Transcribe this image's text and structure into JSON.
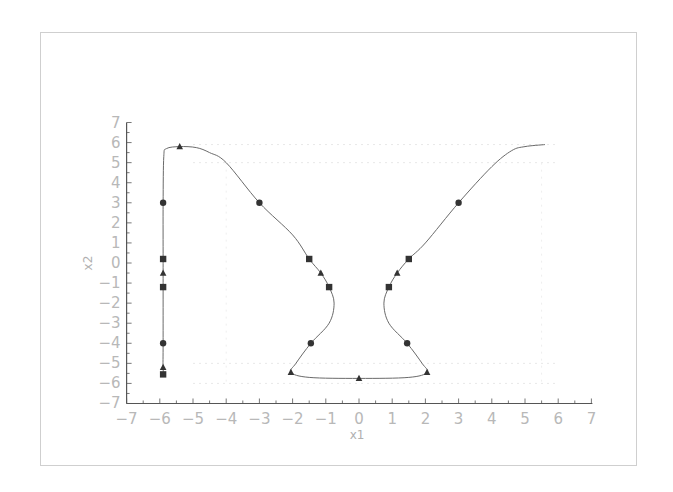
{
  "chart_data": {
    "type": "line",
    "title": "",
    "xlabel": "x1",
    "ylabel": "x2",
    "xlim": [
      -7,
      7
    ],
    "ylim": [
      -7,
      7
    ],
    "xticks": [
      -7,
      -6,
      -5,
      -4,
      -3,
      -2,
      -1,
      0,
      1,
      2,
      3,
      4,
      5,
      6,
      7
    ],
    "yticks": [
      -7,
      -6,
      -5,
      -4,
      -3,
      -2,
      -1,
      0,
      1,
      2,
      3,
      4,
      5,
      6,
      7
    ],
    "grid": false,
    "legend": null,
    "series": [
      {
        "name": "left-trajectory",
        "curve": [
          [
            -5.85,
            -5.65
          ],
          [
            -5.9,
            -5.3
          ],
          [
            -5.9,
            -4
          ],
          [
            -5.9,
            -1.2
          ],
          [
            -5.9,
            0.2
          ],
          [
            -5.9,
            3
          ],
          [
            -5.88,
            5.3
          ],
          [
            -5.8,
            5.7
          ],
          [
            -5.4,
            5.8
          ],
          [
            -4.9,
            5.75
          ],
          [
            -4.5,
            5.5
          ],
          [
            -4,
            5
          ],
          [
            -3,
            3
          ],
          [
            -2,
            1.4
          ],
          [
            -1.5,
            0.2
          ],
          [
            -1.15,
            -0.5
          ],
          [
            -0.9,
            -1.2
          ],
          [
            -0.75,
            -2
          ],
          [
            -0.9,
            -3
          ],
          [
            -1.45,
            -4
          ],
          [
            -1.9,
            -5
          ],
          [
            -2.05,
            -5.45
          ],
          [
            -1.5,
            -5.7
          ],
          [
            0,
            -5.75
          ],
          [
            1.5,
            -5.7
          ],
          [
            2.05,
            -5.45
          ],
          [
            1.9,
            -5
          ],
          [
            1.45,
            -4
          ],
          [
            0.9,
            -3
          ],
          [
            0.75,
            -2
          ],
          [
            0.9,
            -1.2
          ],
          [
            1.15,
            -0.5
          ],
          [
            1.5,
            0.2
          ],
          [
            2,
            1
          ],
          [
            3,
            3
          ],
          [
            4,
            4.8
          ],
          [
            4.6,
            5.6
          ],
          [
            5,
            5.8
          ],
          [
            5.6,
            5.9
          ]
        ]
      }
    ],
    "markers": {
      "circle": [
        [
          -5.9,
          3
        ],
        [
          -5.9,
          -4
        ],
        [
          -3,
          3
        ],
        [
          -1.45,
          -4
        ],
        [
          1.45,
          -4
        ],
        [
          3,
          3
        ]
      ],
      "square": [
        [
          -5.9,
          0.2
        ],
        [
          -5.9,
          -1.2
        ],
        [
          -1.5,
          0.2
        ],
        [
          -0.9,
          -1.2
        ],
        [
          0.9,
          -1.2
        ],
        [
          1.5,
          0.2
        ],
        [
          -5.9,
          -5.55
        ]
      ],
      "triangle": [
        [
          -5.4,
          5.8
        ],
        [
          -5.9,
          -0.5
        ],
        [
          -5.9,
          -5.2
        ],
        [
          -1.15,
          -0.5
        ],
        [
          1.15,
          -0.5
        ],
        [
          -2.05,
          -5.45
        ],
        [
          0,
          -5.75
        ],
        [
          2.05,
          -5.45
        ]
      ]
    }
  },
  "colors": {
    "axis": "#555555",
    "curve": "#6a6a6a",
    "marker": "#333333",
    "tick_label": "#b8b8b8",
    "frame": "#cfcfcf"
  }
}
